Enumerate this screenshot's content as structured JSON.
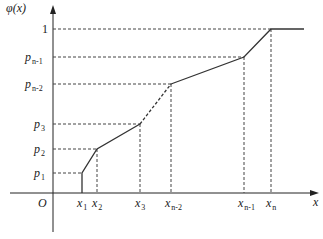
{
  "diagram": {
    "colors": {
      "axis": "#222222",
      "curve": "#333333",
      "guide": "#444444",
      "background": "#ffffff"
    },
    "y_axis_label": {
      "main": "φ(x)"
    },
    "x_axis_label": {
      "main": "x"
    },
    "origin_label": "O",
    "y_ticks": [
      {
        "main": "1",
        "sub": "",
        "y": 29
      },
      {
        "main": "p",
        "sub": "n-1",
        "y": 57
      },
      {
        "main": "p",
        "sub": "n-2",
        "y": 84
      },
      {
        "main": "p",
        "sub": "3",
        "y": 124
      },
      {
        "main": "p",
        "sub": "2",
        "y": 149
      },
      {
        "main": "p",
        "sub": "1",
        "y": 173
      }
    ],
    "x_ticks": [
      {
        "main": "x",
        "sub": "1",
        "x": 82
      },
      {
        "main": "x",
        "sub": "2",
        "x": 97
      },
      {
        "main": "x",
        "sub": "3",
        "x": 140
      },
      {
        "main": "x",
        "sub": "n-2",
        "x": 171
      },
      {
        "main": "x",
        "sub": "n-1",
        "x": 244
      },
      {
        "main": "x",
        "sub": "n",
        "x": 271
      }
    ],
    "curve_segments": [
      {
        "from": "x1,0",
        "to": "x1,p1",
        "style": "solid"
      },
      {
        "from": "x1,p1",
        "to": "x2,p2",
        "style": "solid"
      },
      {
        "from": "x2,p2",
        "to": "x3,p3",
        "style": "solid"
      },
      {
        "from": "x3,p3",
        "to": "x_{n-2},p_{n-2}",
        "style": "dashed"
      },
      {
        "from": "x_{n-2},p_{n-2}",
        "to": "x_{n-1},p_{n-1}",
        "style": "solid"
      },
      {
        "from": "x_{n-1},p_{n-1}",
        "to": "x_n,1",
        "style": "solid"
      },
      {
        "from": "x_n,1",
        "to": "beyond,1",
        "style": "solid"
      }
    ]
  }
}
